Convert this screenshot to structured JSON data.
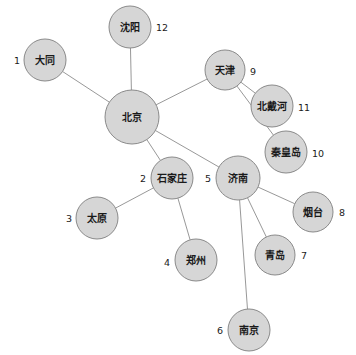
{
  "diagram": {
    "type": "node-link-graph",
    "title": "",
    "background_color": "#ffffff",
    "node_fill_color": "#d6d6d6",
    "node_stroke_color": "#8a8a8a",
    "edge_color": "#8c8c8c",
    "label_color": "#1a1a1a",
    "nodes": [
      {
        "id": "datong",
        "label": "大同",
        "index": "1",
        "cx": 45,
        "cy": 60,
        "r": 21,
        "index_x": 20,
        "index_y": 60,
        "index_side": "left"
      },
      {
        "id": "shijiazhuang",
        "label": "石家庄",
        "index": "2",
        "cx": 172,
        "cy": 178,
        "r": 21,
        "index_x": 146,
        "index_y": 178,
        "index_side": "left"
      },
      {
        "id": "taiyuan",
        "label": "太原",
        "index": "3",
        "cx": 97,
        "cy": 218,
        "r": 21,
        "index_x": 72,
        "index_y": 218,
        "index_side": "left"
      },
      {
        "id": "zhengzhou",
        "label": "郑州",
        "index": "4",
        "cx": 196,
        "cy": 260,
        "r": 21,
        "index_x": 170,
        "index_y": 262,
        "index_side": "left"
      },
      {
        "id": "jinan",
        "label": "济南",
        "index": "5",
        "cx": 238,
        "cy": 178,
        "r": 22,
        "index_x": 211,
        "index_y": 178,
        "index_side": "left"
      },
      {
        "id": "nanjing",
        "label": "南京",
        "index": "6",
        "cx": 249,
        "cy": 330,
        "r": 21,
        "index_x": 223,
        "index_y": 330,
        "index_side": "left"
      },
      {
        "id": "qingdao",
        "label": "青岛",
        "index": "7",
        "cx": 275,
        "cy": 255,
        "r": 20,
        "index_x": 301,
        "index_y": 255,
        "index_side": "right"
      },
      {
        "id": "yantai",
        "label": "烟台",
        "index": "8",
        "cx": 313,
        "cy": 212,
        "r": 20,
        "index_x": 339,
        "index_y": 212,
        "index_side": "right"
      },
      {
        "id": "tianjin",
        "label": "天津",
        "index": "9",
        "cx": 225,
        "cy": 70,
        "r": 20,
        "index_x": 250,
        "index_y": 71,
        "index_side": "right"
      },
      {
        "id": "qinhuangdao",
        "label": "秦皇岛",
        "index": "10",
        "cx": 286,
        "cy": 152,
        "r": 21,
        "index_x": 312,
        "index_y": 153,
        "index_side": "right"
      },
      {
        "id": "beidaihe",
        "label": "北戴河",
        "index": "11",
        "cx": 272,
        "cy": 106,
        "r": 21,
        "index_x": 298,
        "index_y": 107,
        "index_side": "right"
      },
      {
        "id": "shenyang",
        "label": "沈阳",
        "index": "12",
        "cx": 130,
        "cy": 27,
        "r": 21,
        "index_x": 156,
        "index_y": 27,
        "index_side": "right"
      },
      {
        "id": "beijing",
        "label": "北京",
        "index": "",
        "cx": 132,
        "cy": 117,
        "r": 27,
        "index_x": 0,
        "index_y": 0,
        "index_side": "none"
      }
    ],
    "edges": [
      {
        "from": "beijing",
        "to": "shenyang"
      },
      {
        "from": "beijing",
        "to": "datong"
      },
      {
        "from": "beijing",
        "to": "tianjin"
      },
      {
        "from": "beijing",
        "to": "shijiazhuang"
      },
      {
        "from": "beijing",
        "to": "jinan"
      },
      {
        "from": "tianjin",
        "to": "beidaihe"
      },
      {
        "from": "tianjin",
        "to": "qinhuangdao"
      },
      {
        "from": "shijiazhuang",
        "to": "taiyuan"
      },
      {
        "from": "shijiazhuang",
        "to": "zhengzhou"
      },
      {
        "from": "jinan",
        "to": "yantai"
      },
      {
        "from": "jinan",
        "to": "qingdao"
      },
      {
        "from": "jinan",
        "to": "nanjing"
      }
    ]
  }
}
